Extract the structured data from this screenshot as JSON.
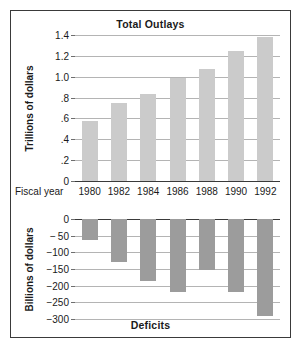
{
  "figure": {
    "x_axis_caption": "Fiscal year",
    "years": [
      "1980",
      "1982",
      "1984",
      "1986",
      "1988",
      "1990",
      "1992"
    ],
    "bar_color_outlays": "#cbcbcb",
    "bar_color_deficits": "#9c9c9c",
    "grid_color": "#b4b4b4",
    "axis_color": "#3a3a3a",
    "border_color": "#3a3a3a",
    "background": "#ffffff"
  },
  "chart_data": [
    {
      "type": "bar",
      "title": "Total Outlays",
      "xlabel": "Fiscal year",
      "ylabel": "Trillions of dollars",
      "categories": [
        "1980",
        "1982",
        "1984",
        "1986",
        "1988",
        "1990",
        "1992"
      ],
      "values": [
        0.58,
        0.75,
        0.83,
        0.99,
        1.07,
        1.25,
        1.38
      ],
      "ylim": [
        0,
        1.4
      ],
      "yticks": [
        0,
        0.2,
        0.4,
        0.6,
        0.8,
        1.0,
        1.2,
        1.4
      ],
      "ytick_labels": [
        "0",
        ".2",
        ".4",
        ".6",
        ".8",
        "1.0",
        "1.2",
        "1.4"
      ],
      "grid": true,
      "legend": "none",
      "orientation": "vertical",
      "direction": "up"
    },
    {
      "type": "bar",
      "title": "Deficits",
      "xlabel": "Fiscal year",
      "ylabel": "Billions of dollars",
      "categories": [
        "1980",
        "1982",
        "1984",
        "1986",
        "1988",
        "1990",
        "1992"
      ],
      "values": [
        -62,
        -128,
        -185,
        -218,
        -152,
        -218,
        -290
      ],
      "ylim": [
        -300,
        0
      ],
      "yticks": [
        0,
        -50,
        -100,
        -150,
        -200,
        -250,
        -300
      ],
      "ytick_labels": [
        "0",
        "− 50",
        "−100",
        "−150",
        "−200",
        "−250",
        "−300"
      ],
      "grid": true,
      "legend": "none",
      "orientation": "vertical",
      "direction": "down"
    }
  ]
}
